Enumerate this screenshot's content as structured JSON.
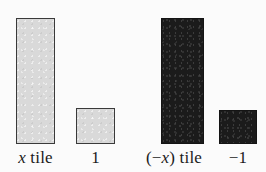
{
  "figure": {
    "background_color": "#fbfbfb",
    "light_tile_fill": "#d9d9d9",
    "light_tile_border": "#3a3a3a",
    "dark_tile_fill": "#1b1b1b",
    "dark_tile_border": "#141414",
    "text_color": "#1a1a1a"
  },
  "tiles": [
    {
      "id": "x-tile",
      "label_plain": "x tile",
      "label_prefix": "",
      "label_var": "x",
      "label_suffix": " tile",
      "shade": "light",
      "shape": "tall-rectangle"
    },
    {
      "id": "one-tile",
      "label_plain": "1",
      "label_prefix": "1",
      "label_var": "",
      "label_suffix": "",
      "shade": "light",
      "shape": "small-square"
    },
    {
      "id": "negative-x-tile",
      "label_plain": "(−x) tile",
      "label_prefix": "(−",
      "label_var": "x",
      "label_suffix": ") tile",
      "shade": "dark",
      "shape": "tall-rectangle"
    },
    {
      "id": "negative-one-tile",
      "label_plain": "−1",
      "label_prefix": "−1",
      "label_var": "",
      "label_suffix": "",
      "shade": "dark",
      "shape": "small-square"
    }
  ]
}
